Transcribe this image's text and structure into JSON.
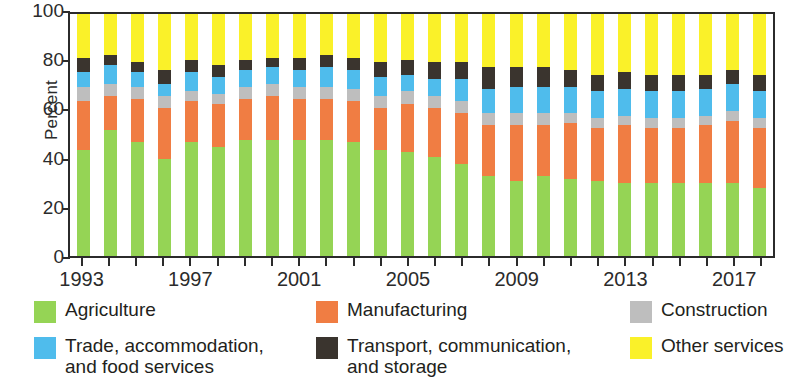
{
  "chart_data": {
    "type": "bar",
    "subtype": "stacked-bar-100",
    "title": "",
    "xlabel": "",
    "ylabel": "Percent",
    "ylim": [
      0,
      100
    ],
    "yticks": [
      0,
      20,
      40,
      60,
      80,
      100
    ],
    "grid": false,
    "legend_position": "bottom",
    "categories": [
      "1993",
      "1994",
      "1995",
      "1996",
      "1997",
      "1998",
      "1999",
      "2000",
      "2001",
      "2002",
      "2003",
      "2004",
      "2005",
      "2006",
      "2007",
      "2008",
      "2009",
      "2010",
      "2011",
      "2012",
      "2013",
      "2014",
      "2015",
      "2016",
      "2017",
      "2018"
    ],
    "xtick_labels": [
      "1993",
      "1997",
      "2001",
      "2005",
      "2009",
      "2013",
      "2017"
    ],
    "series": [
      {
        "name": "Agriculture",
        "color": "#95D455",
        "values": [
          44,
          52,
          47,
          40,
          47,
          45,
          48,
          48,
          48,
          48,
          47,
          44,
          43,
          41,
          38,
          33,
          31,
          33,
          32,
          31,
          30,
          30,
          30,
          30,
          30,
          28
        ]
      },
      {
        "name": "Manufacturing",
        "color": "#F07D43",
        "values": [
          20,
          14,
          18,
          21,
          17,
          18,
          17,
          18,
          17,
          17,
          17,
          17,
          20,
          20,
          21,
          21,
          23,
          21,
          23,
          22,
          24,
          23,
          23,
          24,
          26,
          25
        ]
      },
      {
        "name": "Construction",
        "color": "#BEBEBE",
        "values": [
          6,
          5,
          5,
          5,
          4,
          4,
          5,
          5,
          5,
          5,
          5,
          5,
          5,
          5,
          5,
          5,
          5,
          5,
          4,
          4,
          4,
          4,
          4,
          4,
          4,
          4
        ]
      },
      {
        "name": "Trade, accommodation,\nand food services",
        "color": "#4FBCEC",
        "values": [
          6,
          8,
          6,
          5,
          8,
          7,
          7,
          7,
          7,
          8,
          8,
          8,
          7,
          7,
          9,
          10,
          11,
          11,
          11,
          11,
          11,
          11,
          11,
          11,
          11,
          11
        ]
      },
      {
        "name": "Transport, communication,\nand storage",
        "color": "#3A342E",
        "values": [
          6,
          4,
          4,
          6,
          5,
          5,
          4,
          4,
          5,
          5,
          5,
          6,
          6,
          7,
          7,
          9,
          8,
          8,
          7,
          7,
          7,
          7,
          7,
          6,
          6,
          7
        ]
      },
      {
        "name": "Other services",
        "color": "#FAF129",
        "values": [
          18,
          17,
          20,
          23,
          19,
          21,
          19,
          18,
          18,
          17,
          18,
          20,
          19,
          20,
          20,
          22,
          22,
          22,
          23,
          25,
          24,
          25,
          25,
          25,
          23,
          25
        ]
      }
    ]
  },
  "axis": {
    "ylabel": "Percent",
    "ytick_labels": [
      "0",
      "20",
      "40",
      "60",
      "80",
      "100"
    ]
  },
  "legend": {
    "items": [
      {
        "label": "Agriculture",
        "color": "#95D455"
      },
      {
        "label": "Manufacturing",
        "color": "#F07D43"
      },
      {
        "label": "Construction",
        "color": "#BEBEBE"
      },
      {
        "label": "Trade, accommodation,\nand food services",
        "color": "#4FBCEC"
      },
      {
        "label": "Transport, communication,\nand storage",
        "color": "#3A342E"
      },
      {
        "label": "Other services",
        "color": "#FAF129"
      }
    ]
  }
}
